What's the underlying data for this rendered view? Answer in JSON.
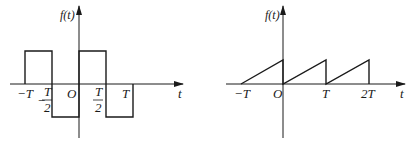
{
  "colors": {
    "line": "#1a1a1a",
    "axis": "#333333",
    "background": "#ffffff"
  },
  "left_plot": {
    "y_axis_label": "f(t)",
    "x_axis_label": "t",
    "origin_label": "O",
    "ticks": {
      "neg_T": "−T",
      "neg_half_T_num": "T",
      "neg_half_T_den": "2",
      "neg_sign": "−",
      "half_T_num": "T",
      "half_T_den": "2",
      "T": "T"
    },
    "description": "Square wave: +1 on (−T, −T/2), −1 on (−T/2, 0), +1 on (0, T/2), −1 on (T/2, T)"
  },
  "right_plot": {
    "y_axis_label": "f(t)",
    "x_axis_label": "t",
    "origin_label": "O",
    "ticks": {
      "neg_T": "−T",
      "T": "T",
      "two_T": "2T"
    },
    "description": "Sawtooth wave: linear rise from 0 at t=−T to peak at t=0, then repeats each period T up to 2T"
  }
}
